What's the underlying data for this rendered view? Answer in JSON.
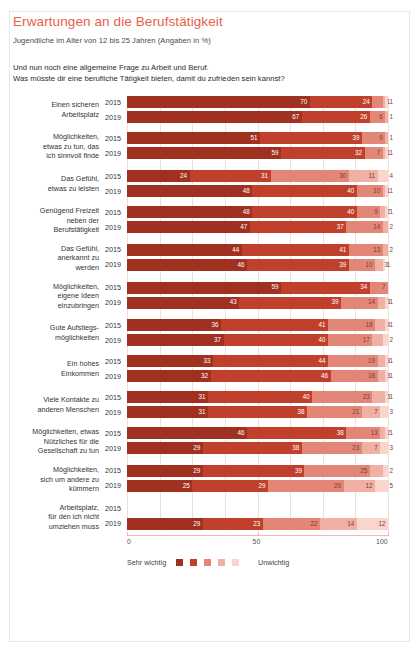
{
  "header": {
    "title": "Erwartungen an die Berufstätigkeit",
    "subtitle": "Jugendliche im Alter von 12 bis 25 Jahren (Angaben in %)",
    "question_line1": "Und nun noch eine allgemeine Frage zu Arbeit und Beruf.",
    "question_line2": "Was müsste dir eine berufliche Tätigkeit bieten, damit du zufrieden sein kannst?"
  },
  "legend": {
    "left_label": "Sehr wichtig",
    "right_label": "Unwichtig",
    "colors": [
      "#a0301f",
      "#c0402c",
      "#e28777",
      "#f0b0a3",
      "#f8d5cd"
    ]
  },
  "axis": {
    "ticks": [
      "0",
      "50",
      "100"
    ],
    "min": 0,
    "max": 100
  },
  "series_years": [
    "2015",
    "2019"
  ],
  "chart_data": {
    "type": "bar",
    "subtype": "stacked-horizontal-likert",
    "title": "Erwartungen an die Berufstätigkeit",
    "subtitle": "Jugendliche im Alter von 12 bis 25 Jahren (Angaben in %)",
    "xlabel": "",
    "ylabel": "",
    "xlim": [
      0,
      100
    ],
    "grid": true,
    "legend_position": "bottom",
    "scale_labels": [
      "Sehr wichtig",
      "",
      "",
      "",
      "Unwichtig"
    ],
    "scale_colors": [
      "#a0301f",
      "#c0402c",
      "#e28777",
      "#f0b0a3",
      "#f8d5cd"
    ],
    "categories": [
      "Einen sicheren Arbeitsplatz",
      "Möglichkeiten, etwas zu tun, das ich sinnvoll finde",
      "Das Gefühl, etwas zu leisten",
      "Genügend Freizeit neben der Berufstätigkeit",
      "Das Gefühl, anerkannt zu werden",
      "Möglichkeiten, eigene Ideen einzubringen",
      "Gute Aufstiegsmöglichkeiten",
      "Ein hohes Einkommen",
      "Viele Kontakte zu anderen Menschen",
      "Möglichkeiten, etwas Nützliches für die Gesellschaft zu tun",
      "Möglichkeiten, sich um andere zu kümmern",
      "Arbeitsplatz, für den ich nicht umziehen muss"
    ],
    "groups": [
      {
        "label_lines": [
          "Einen sicheren",
          "Arbeitsplatz"
        ],
        "rows": [
          {
            "year": "2015",
            "values": [
              70,
              24,
              4,
              1,
              1
            ]
          },
          {
            "year": "2019",
            "values": [
              67,
              26,
              6,
              1,
              0
            ]
          }
        ]
      },
      {
        "label_lines": [
          "Möglichkeiten,",
          "etwas zu tun, das",
          "ich sinnvoll finde"
        ],
        "rows": [
          {
            "year": "2015",
            "values": [
              51,
              39,
              9,
              1,
              0
            ]
          },
          {
            "year": "2019",
            "values": [
              59,
              32,
              7,
              1,
              1
            ]
          }
        ]
      },
      {
        "label_lines": [
          "Das Gefühl,",
          "etwas zu leisten"
        ],
        "rows": [
          {
            "year": "2015",
            "values": [
              24,
              31,
              30,
              11,
              4
            ]
          },
          {
            "year": "2019",
            "values": [
              48,
              40,
              10,
              1,
              1
            ]
          }
        ]
      },
      {
        "label_lines": [
          "Genügend Freizeit",
          "neben der",
          "Berufstätigkeit"
        ],
        "rows": [
          {
            "year": "2015",
            "values": [
              48,
              40,
              9,
              2,
              1
            ]
          },
          {
            "year": "2019",
            "values": [
              47,
              37,
              14,
              2,
              0
            ]
          }
        ]
      },
      {
        "label_lines": [
          "Das Gefühl,",
          "anerkannt zu",
          "werden"
        ],
        "rows": [
          {
            "year": "2015",
            "values": [
              44,
              41,
              13,
              2,
              0
            ]
          },
          {
            "year": "2019",
            "values": [
              46,
              39,
              10,
              3,
              1
            ]
          }
        ]
      },
      {
        "label_lines": [
          "Möglichkeiten,",
          "eigene Ideen",
          "einzubringen"
        ],
        "rows": [
          {
            "year": "2015",
            "values": [
              59,
              34,
              7,
              0,
              0
            ]
          },
          {
            "year": "2019",
            "values": [
              43,
              39,
              14,
              3,
              1
            ]
          }
        ]
      },
      {
        "label_lines": [
          "Gute Aufstiegs-",
          "möglichkeiten"
        ],
        "rows": [
          {
            "year": "2015",
            "values": [
              36,
              41,
              18,
              4,
              1
            ]
          },
          {
            "year": "2019",
            "values": [
              37,
              40,
              17,
              4,
              2
            ]
          }
        ]
      },
      {
        "label_lines": [
          "Ein hohes",
          "Einkommen"
        ],
        "rows": [
          {
            "year": "2015",
            "values": [
              33,
              44,
              19,
              3,
              1
            ]
          },
          {
            "year": "2019",
            "values": [
              32,
              46,
              18,
              3,
              1
            ]
          }
        ]
      },
      {
        "label_lines": [
          "Viele Kontakte zu",
          "anderen Menschen"
        ],
        "rows": [
          {
            "year": "2015",
            "values": [
              31,
              40,
              23,
              5,
              1
            ]
          },
          {
            "year": "2019",
            "values": [
              31,
              38,
              21,
              7,
              3
            ]
          }
        ]
      },
      {
        "label_lines": [
          "Möglichkeiten, etwas",
          "Nützliches für die",
          "Gesellschaft zu tun"
        ],
        "rows": [
          {
            "year": "2015",
            "values": [
              46,
              38,
              13,
              2,
              1
            ]
          },
          {
            "year": "2019",
            "values": [
              29,
              38,
              23,
              7,
              3
            ]
          }
        ]
      },
      {
        "label_lines": [
          "Möglichkeiten,",
          "sich um andere zu",
          "kümmern"
        ],
        "rows": [
          {
            "year": "2015",
            "values": [
              29,
              39,
              25,
              5,
              2
            ]
          },
          {
            "year": "2019",
            "values": [
              25,
              29,
              29,
              12,
              5
            ]
          }
        ]
      },
      {
        "label_lines": [
          "Arbeitsplatz,",
          "für den ich nicht",
          "umziehen muss"
        ],
        "rows": [
          {
            "year": "2015",
            "values": []
          },
          {
            "year": "2019",
            "values": [
              29,
              23,
              22,
              14,
              12
            ]
          }
        ]
      }
    ]
  }
}
